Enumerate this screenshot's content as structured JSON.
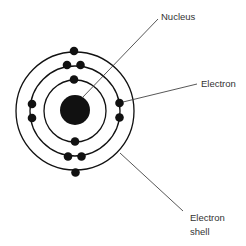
{
  "labels": {
    "nucleus": "Nucleus",
    "electron": "Electron",
    "electron_shell_line1": "Electron",
    "electron_shell_line2": "shell"
  },
  "atom": {
    "center": [
      75,
      110
    ],
    "nucleus_radius": 15,
    "shells": [
      {
        "name": "inner",
        "radius": 31,
        "electrons": 2
      },
      {
        "name": "middle",
        "radius": 45,
        "electrons": 8
      },
      {
        "name": "outer",
        "radius": 59,
        "electrons": 2
      }
    ],
    "total_electrons": 12
  },
  "colors": {
    "ink": "#111111",
    "leader_line": "#444444",
    "text": "#333333",
    "background": "#ffffff"
  }
}
